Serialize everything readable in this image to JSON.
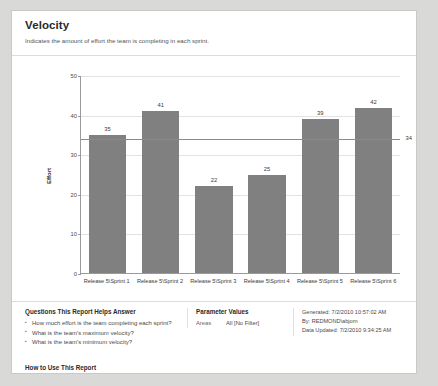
{
  "report": {
    "title": "Velocity",
    "subtitle": "Indicates the amount of effort the team is completing in each sprint."
  },
  "chart_data": {
    "type": "bar",
    "title": "",
    "xlabel": "",
    "ylabel": "Effort",
    "categories": [
      "Release 5\\Sprint 1",
      "Release 5\\Sprint 2",
      "Release 5\\Sprint 3",
      "Release 5\\Sprint 4",
      "Release 5\\Sprint 5",
      "Release 5\\Sprint 6"
    ],
    "values": [
      35,
      41,
      22,
      25,
      39,
      42
    ],
    "ylim": [
      0,
      50
    ],
    "yticks": [
      0,
      10,
      20,
      30,
      40,
      50
    ],
    "grid": true,
    "legend": "none",
    "bar_color": "#808080",
    "reference_line": {
      "label": "34",
      "value": 34,
      "color": "#8a8a8a"
    }
  },
  "footer": {
    "questions_heading": "Questions This Report Helps Answer",
    "questions": [
      "How much effort is the team completing each sprint?",
      "What is the team's maximum velocity?",
      "What is the team's minimum velocity?"
    ],
    "howto_link": "How to Use This Report",
    "parameters_heading": "Parameter Values",
    "parameters": [
      {
        "name": "Areas",
        "value": "All [No Filter]"
      }
    ],
    "meta": [
      "Generated: 7/2/2010 10:57:02 AM",
      "By: REDMOND\\abjorn",
      "Data Updated: 7/2/2010 9:34:25 AM"
    ]
  }
}
